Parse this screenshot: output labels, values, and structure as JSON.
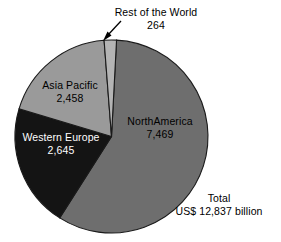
{
  "chart_data": {
    "type": "pie",
    "title": "",
    "subtitle": "",
    "xlabel": "",
    "ylabel": "",
    "units": "US$ billion",
    "legend_position": "none",
    "grid": false,
    "start_angle_deg": 3,
    "direction": "clockwise",
    "categories": [
      "NorthAmerica",
      "Western Europe",
      "Asia Pacific",
      "Rest of the World"
    ],
    "values": [
      7469,
      2645,
      2458,
      264
    ],
    "value_labels": [
      "7,469",
      "2,645",
      "2,458",
      "264"
    ],
    "total": 12837,
    "total_label": "12,837",
    "slices": [
      {
        "name": "NorthAmerica",
        "value": 7469,
        "value_label": "7,469",
        "color": "#6e6e6e",
        "label_color": "#000000",
        "label_placement": "inside"
      },
      {
        "name": "Western Europe",
        "value": 2645,
        "value_label": "2,645",
        "color": "#141414",
        "label_color": "#ffffff",
        "label_placement": "inside"
      },
      {
        "name": "Asia Pacific",
        "value": 2458,
        "value_label": "2,458",
        "color": "#9a9a9a",
        "label_color": "#000000",
        "label_placement": "inside"
      },
      {
        "name": "Rest of the World",
        "value": 264,
        "value_label": "264",
        "color": "#b4b4b4",
        "label_color": "#000000",
        "label_placement": "callout"
      }
    ],
    "annotations": [
      {
        "name": "total-annotation",
        "line1": "Total",
        "line2": "US$ 12,837 billion"
      }
    ],
    "callout": {
      "name": "rest-of-the-world-arrow",
      "target_slice": "Rest of the World"
    }
  },
  "labels": {
    "rest_of_the_world": {
      "name": "Rest of the World",
      "value": "264"
    },
    "asia_pacific": {
      "name": "Asia Pacific",
      "value": "2,458"
    },
    "western_europe": {
      "name": "Western Europe",
      "value": "2,645"
    },
    "northamerica": {
      "name": "NorthAmerica",
      "value": "7,469"
    },
    "total": {
      "line1": "Total",
      "line2": "US$ 12,837 billion"
    }
  },
  "colors": {
    "northamerica": "#6e6e6e",
    "western_europe": "#141414",
    "asia_pacific": "#9a9a9a",
    "rest_of_the_world": "#b4b4b4",
    "outline": "#1a1a1a",
    "background": "#ffffff"
  }
}
